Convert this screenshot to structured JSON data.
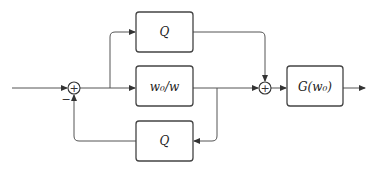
{
  "diagram": {
    "type": "block-diagram",
    "blocks": {
      "q_top": {
        "label": "Q"
      },
      "w_ratio": {
        "label": "w₀/w"
      },
      "q_bottom": {
        "label": "Q"
      },
      "g": {
        "label": "G(w₀)"
      }
    },
    "summing_junctions": {
      "sum1": {
        "symbol": "+",
        "feedback_sign": "−"
      },
      "sum2": {
        "symbol": "+"
      }
    },
    "colors": {
      "line": "#555555",
      "box_border": "#444444",
      "background": "#ffffff"
    }
  }
}
